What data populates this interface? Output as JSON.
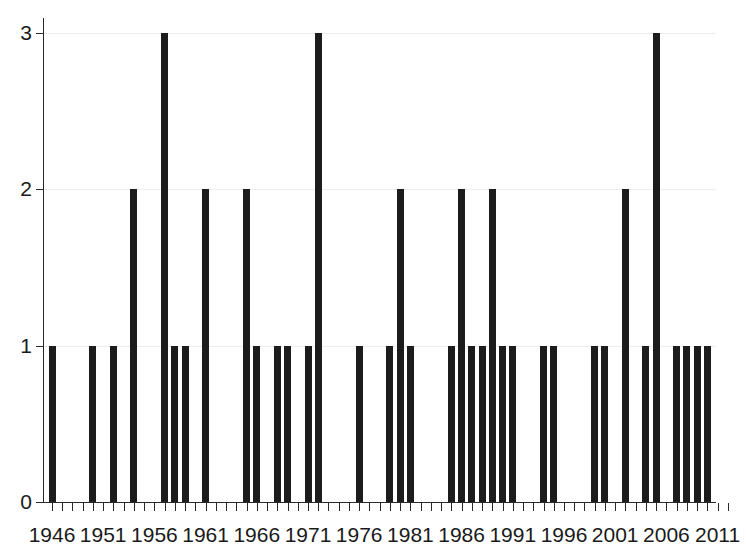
{
  "chart_data": {
    "type": "bar",
    "title": "",
    "subtitle": "",
    "xlabel": "",
    "ylabel": "",
    "xlim": [
      1945,
      2012
    ],
    "ylim": [
      0,
      3
    ],
    "grid": true,
    "legend": null,
    "y_ticks": [
      "0",
      "1",
      "2",
      "3"
    ],
    "y_tick_values": [
      0,
      1,
      2,
      3
    ],
    "x_ticks": [
      "1946",
      "1951",
      "1956",
      "1961",
      "1966",
      "1971",
      "1976",
      "1981",
      "1986",
      "1991",
      "1996",
      "2001",
      "2006",
      "2011"
    ],
    "x_tick_values": [
      1946,
      1951,
      1956,
      1961,
      1966,
      1971,
      1976,
      1981,
      1986,
      1991,
      1996,
      2001,
      2006,
      2011
    ],
    "x_minor_tick_step": 1,
    "bar_color": "#1c1c1c",
    "axis_color": "#2a2a2a",
    "grid_color": "#ededed",
    "background_color": "#ffffff",
    "categories": [
      1946,
      1950,
      1952,
      1954,
      1957,
      1958,
      1959,
      1961,
      1965,
      1966,
      1968,
      1969,
      1971,
      1972,
      1976,
      1979,
      1980,
      1981,
      1985,
      1986,
      1987,
      1988,
      1989,
      1990,
      1991,
      1994,
      1995,
      1999,
      2000,
      2002,
      2004,
      2005,
      2007,
      2008,
      2009,
      2010
    ],
    "values": [
      1,
      1,
      1,
      2,
      3,
      1,
      1,
      2,
      2,
      1,
      1,
      1,
      1,
      3,
      1,
      1,
      2,
      1,
      1,
      2,
      1,
      1,
      2,
      1,
      1,
      1,
      1,
      1,
      1,
      2,
      1,
      3,
      1,
      1,
      1,
      1
    ]
  }
}
